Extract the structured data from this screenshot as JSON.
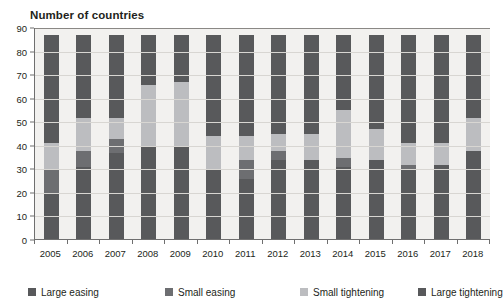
{
  "chart_data": {
    "type": "bar",
    "title": "Number of countries",
    "xlabel": "",
    "ylabel": "Number of countries",
    "ylim": [
      0,
      90
    ],
    "ytick_step": 10,
    "yticks": [
      0,
      10,
      20,
      30,
      40,
      50,
      60,
      70,
      80,
      90
    ],
    "grid": true,
    "stacked": true,
    "legend_position": "bottom",
    "total_per_bar": 87,
    "categories": [
      "2005",
      "2006",
      "2007",
      "2008",
      "2009",
      "2010",
      "2011",
      "2012",
      "2013",
      "2014",
      "2015",
      "2016",
      "2017",
      "2018"
    ],
    "series": [
      {
        "name": "Large easing",
        "color": "#58595b",
        "values": [
          20,
          31,
          37,
          40,
          40,
          30,
          26,
          34,
          34,
          31,
          34,
          30,
          32,
          38
        ]
      },
      {
        "name": "Small easing",
        "color": "#6d6e71",
        "values": [
          10,
          7,
          6,
          0,
          0,
          0,
          8,
          4,
          0,
          4,
          0,
          2,
          0,
          0
        ]
      },
      {
        "name": "Small tightening",
        "color": "#bcbdc0",
        "values": [
          11,
          14,
          9,
          26,
          27,
          14,
          10,
          7,
          11,
          20,
          13,
          9,
          9,
          14
        ]
      },
      {
        "name": "Large tightening",
        "color": "#58595b",
        "values": [
          46,
          35,
          35,
          21,
          20,
          43,
          43,
          42,
          42,
          32,
          40,
          46,
          46,
          35
        ]
      }
    ]
  },
  "legend": {
    "items": [
      {
        "label": "Large easing",
        "color": "#58595b"
      },
      {
        "label": "Small easing",
        "color": "#6d6e71"
      },
      {
        "label": "Small tightening",
        "color": "#bcbdc0"
      },
      {
        "label": "Large tightening",
        "color": "#58595b"
      }
    ]
  },
  "colors": {
    "plot_background": "#f2f1ef",
    "gridline": "#d8d6d2",
    "axis": "#6f6f6f",
    "text": "#231f20"
  }
}
